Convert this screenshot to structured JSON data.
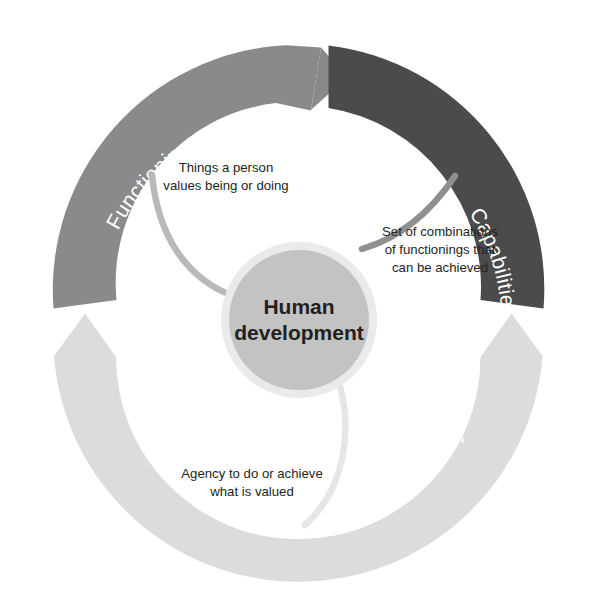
{
  "diagram": {
    "title_center_line1": "Human",
    "title_center_line2": "development",
    "arcs": [
      {
        "id": "functionings",
        "label": "Functionings",
        "color": "#8a8a8a",
        "position": "top-left"
      },
      {
        "id": "capabilities",
        "label": "Capabilities",
        "color": "#4b4b4b",
        "position": "top-right"
      },
      {
        "id": "voice-and-autonomy",
        "label": "Voice and autonomy",
        "color": "#dcdcdc",
        "position": "bottom"
      }
    ],
    "callouts": [
      {
        "id": "functionings-callout",
        "lines": [
          "Things a person",
          "values being or doing"
        ],
        "line1": "Things a person",
        "line2": "values being or doing",
        "connector_color": "#b3b3b3"
      },
      {
        "id": "capabilities-callout",
        "lines": [
          "Set of combinations",
          "of functionings that",
          "can be achieved"
        ],
        "line1": "Set of combinations",
        "line2": "of functionings that",
        "line3": "can be achieved",
        "connector_color": "#8a8a8a"
      },
      {
        "id": "voice-callout",
        "lines": [
          "Agency to do or achieve",
          "what is valued"
        ],
        "line1": "Agency to do or achieve",
        "line2": "what is valued",
        "connector_color": "#e4e4e4"
      }
    ],
    "colors": {
      "background": "#ffffff",
      "center_fill": "#c3c3c3",
      "center_ring": "#e9e9e9",
      "text_dark": "#231f20",
      "text_light": "#ffffff"
    }
  }
}
